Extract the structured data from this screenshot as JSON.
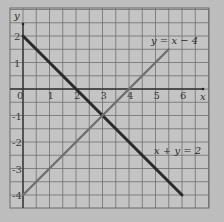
{
  "chart_data": {
    "type": "line",
    "title": "",
    "xlabel": "x",
    "ylabel": "y",
    "xlim": [
      -0.5,
      7
    ],
    "ylim": [
      -4.5,
      3
    ],
    "grid": true,
    "grid_step": 0.5,
    "x_ticks": [
      "0",
      "1",
      "2",
      "3",
      "4",
      "5",
      "6"
    ],
    "y_ticks": [
      "2",
      "1",
      "0",
      "-1",
      "-2",
      "-3",
      "-4"
    ],
    "series": [
      {
        "name": "x + y = 2",
        "equation": "x + y = 2",
        "color": "#2a2a2a",
        "points": [
          [
            0,
            2
          ],
          [
            6,
            -4
          ]
        ]
      },
      {
        "name": "y = x - 4",
        "equation": "y = x − 4",
        "color": "#707070",
        "points": [
          [
            0,
            -4
          ],
          [
            5.5,
            1.5
          ]
        ]
      }
    ],
    "annotations": [
      {
        "text": "y = x − 4",
        "at": [
          4.2,
          1.9
        ]
      },
      {
        "text": "x + y = 2",
        "at": [
          4.5,
          -2.1
        ]
      }
    ],
    "intersection": [
      3,
      -1
    ]
  },
  "labels": {
    "x_axis": "x",
    "y_axis": "y",
    "origin": "0",
    "line1": "y = x − 4",
    "line2": "x + y = 2"
  }
}
